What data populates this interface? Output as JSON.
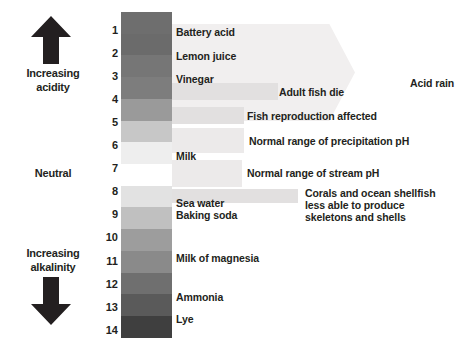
{
  "left_column": {
    "acidity_label": "Increasing\nacidity",
    "acidity_line1": "Increasing",
    "acidity_line2": "acidity",
    "neutral_label": "Neutral",
    "alkalinity_line1": "Increasing",
    "alkalinity_line2": "alkalinity",
    "up_arrow_icon": "arrow-up-icon",
    "down_arrow_icon": "arrow-down-icon"
  },
  "scale": {
    "axis_label": "pH",
    "ticks": [
      "1",
      "2",
      "3",
      "4",
      "5",
      "6",
      "7",
      "8",
      "9",
      "10",
      "11",
      "12",
      "13",
      "14"
    ],
    "neutral_value": 7,
    "min": 1,
    "max": 14,
    "band_colors": [
      "#6e6e6e",
      "#6b6b6b",
      "#767676",
      "#7d7d7d",
      "#9a9a9a",
      "#c7c7c7",
      "#eeeeee",
      "#ffffff",
      "#e2e2e2",
      "#c0c0c0",
      "#9d9d9d",
      "#8a8a8a",
      "#6f6f6f",
      "#5a5a5a",
      "#3f3f3f"
    ]
  },
  "substances": [
    {
      "name": "Battery acid",
      "ph": 1,
      "top": 26
    },
    {
      "name": "Lemon juice",
      "ph": 2,
      "top": 50
    },
    {
      "name": "Vinegar",
      "ph": 3,
      "top": 73
    },
    {
      "name": "Milk",
      "ph": 6.5,
      "top": 150
    },
    {
      "name": "Sea water",
      "ph": 8,
      "top": 197
    },
    {
      "name": "Baking soda",
      "ph": 8.4,
      "top": 209
    },
    {
      "name": "Milk of magnesia",
      "ph": 10,
      "top": 252
    },
    {
      "name": "Ammonia",
      "ph": 12,
      "top": 291
    },
    {
      "name": "Lye",
      "ph": 13,
      "top": 313
    }
  ],
  "annotations": [
    {
      "label": "Acid rain",
      "ph_range": [
        1,
        5.2
      ],
      "text_left": 410,
      "text_top": 77
    },
    {
      "label": "Adult fish die",
      "ph_range": [
        3,
        4.4
      ],
      "text_left": 278,
      "text_top": 86,
      "bar_left": 172,
      "bar_top": 83,
      "bar_width": 104,
      "bar_height": 16
    },
    {
      "label": "Fish reproduction affected",
      "ph_range": [
        4,
        5.2
      ],
      "text_left": 246,
      "text_top": 110,
      "bar_left": 172,
      "bar_top": 107,
      "bar_width": 72,
      "bar_height": 16
    },
    {
      "label": "Normal range of precipitation pH",
      "ph_range": [
        5,
        6
      ],
      "text_left": 248,
      "text_top": 139,
      "bar_left": 172,
      "bar_top": 131,
      "bar_width": 72,
      "bar_height": 22
    },
    {
      "label": "Normal range of stream pH",
      "ph_range": [
        6.5,
        8
      ],
      "text_left": 246,
      "text_top": 172,
      "bar_left": 172,
      "bar_top": 164,
      "bar_width": 70,
      "bar_height": 22
    },
    {
      "label": "Corals and ocean shellfish less able to produce skeletons and shells",
      "ph_range": [
        7.8,
        8.6
      ],
      "text_left": 304,
      "text_top": 190,
      "bar_left": 172,
      "bar_top": 188,
      "bar_width": 125,
      "bar_height": 14,
      "lines": [
        "Corals and ocean shellfish",
        "less able to produce",
        "skeletons and shells"
      ]
    }
  ],
  "colors": {
    "text": "#231f20",
    "bar_fill": "#eceaea",
    "acid_rain_fill": "#f1efef",
    "background": "#ffffff"
  }
}
